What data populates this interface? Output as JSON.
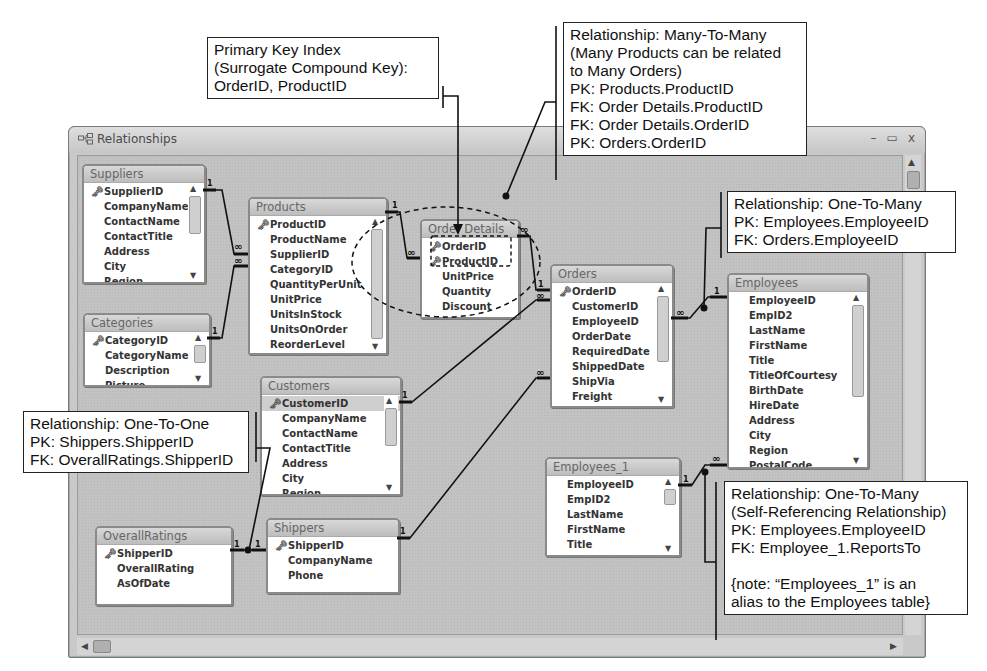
{
  "window": {
    "title": "Relationships",
    "icon": "relationships-icon",
    "controls": {
      "minimize": "–",
      "maximize": "▭",
      "close": "x"
    }
  },
  "tables": {
    "suppliers": {
      "name": "Suppliers",
      "fields": [
        "SupplierID",
        "CompanyName",
        "ContactName",
        "ContactTitle",
        "Address",
        "City",
        "Region"
      ],
      "keys": [
        "SupplierID"
      ]
    },
    "products": {
      "name": "Products",
      "fields": [
        "ProductID",
        "ProductName",
        "SupplierID",
        "CategoryID",
        "QuantityPerUnit",
        "UnitPrice",
        "UnitsInStock",
        "UnitsOnOrder",
        "ReorderLevel"
      ],
      "keys": [
        "ProductID"
      ]
    },
    "categories": {
      "name": "Categories",
      "fields": [
        "CategoryID",
        "CategoryName",
        "Description",
        "Picture"
      ],
      "keys": [
        "CategoryID"
      ]
    },
    "order_details": {
      "name": "Order Details",
      "fields": [
        "OrderID",
        "ProductID",
        "UnitPrice",
        "Quantity",
        "Discount"
      ],
      "keys": [
        "OrderID",
        "ProductID"
      ]
    },
    "orders": {
      "name": "Orders",
      "fields": [
        "OrderID",
        "CustomerID",
        "EmployeeID",
        "OrderDate",
        "RequiredDate",
        "ShippedDate",
        "ShipVia",
        "Freight",
        "ShipName"
      ],
      "keys": [
        "OrderID"
      ]
    },
    "employees": {
      "name": "Employees",
      "fields": [
        "EmployeeID",
        "EmpID2",
        "LastName",
        "FirstName",
        "Title",
        "TitleOfCourtesy",
        "BirthDate",
        "HireDate",
        "Address",
        "City",
        "Region",
        "PostalCode"
      ],
      "keys": []
    },
    "customers": {
      "name": "Customers",
      "fields": [
        "CustomerID",
        "CompanyName",
        "ContactName",
        "ContactTitle",
        "Address",
        "City",
        "Region"
      ],
      "keys": [
        "CustomerID"
      ],
      "selected": "CustomerID"
    },
    "employees_1": {
      "name": "Employees_1",
      "fields": [
        "EmployeeID",
        "EmpID2",
        "LastName",
        "FirstName",
        "Title",
        "TitleOfCourtesy"
      ],
      "keys": []
    },
    "overall_ratings": {
      "name": "OverallRatings",
      "fields": [
        "ShipperID",
        "OverallRating",
        "AsOfDate"
      ],
      "keys": [
        "ShipperID"
      ]
    },
    "shippers": {
      "name": "Shippers",
      "fields": [
        "ShipperID",
        "CompanyName",
        "Phone"
      ],
      "keys": [
        "ShipperID"
      ]
    }
  },
  "cardinality": {
    "one": "1",
    "many": "∞"
  },
  "callouts": {
    "primary_key": {
      "lines": [
        "Primary Key Index",
        "(Surrogate Compound Key):",
        "OrderID, ProductID"
      ]
    },
    "many_to_many": {
      "lines": [
        "Relationship: Many-To-Many",
        "(Many Products can be related",
        "to Many Orders)",
        "PK: Products.ProductID",
        "FK: Order Details.ProductID",
        "FK: Order Details.OrderID",
        "PK: Orders.OrderID"
      ]
    },
    "one_to_many_emp": {
      "lines": [
        "Relationship: One-To-Many",
        "PK: Employees.EmployeeID",
        "FK: Orders.EmployeeID"
      ]
    },
    "one_to_one": {
      "lines": [
        "Relationship: One-To-One",
        "PK: Shippers.ShipperID",
        "FK: OverallRatings.ShipperID"
      ]
    },
    "self_ref": {
      "lines": [
        "Relationship: One-To-Many",
        "(Self-Referencing Relationship)",
        "PK: Employees.EmployeeID",
        "FK: Employee_1.ReportsTo",
        "",
        "{note: “Employees_1” is an",
        "alias to the Employees table}"
      ]
    }
  },
  "colors": {
    "window_bg": "#c2c2c2",
    "table_border": "#8a8a8a",
    "line": "#111111"
  }
}
